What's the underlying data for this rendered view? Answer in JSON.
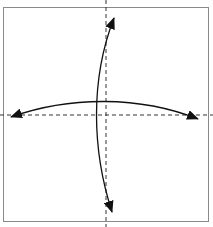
{
  "diagram": {
    "type": "origami-fold-instruction",
    "paper": {
      "shape": "square",
      "x": 3.5,
      "y": 7.5,
      "width": 205,
      "height": 214,
      "fill": "#ffffff",
      "stroke": "#8a8a8a"
    },
    "creases": [
      {
        "name": "vertical-valley-crease",
        "style": "dashed",
        "x1": 106,
        "y1": 0,
        "x2": 106,
        "y2": 227
      },
      {
        "name": "horizontal-valley-crease",
        "style": "dashed",
        "x1": 0,
        "y1": 115,
        "x2": 213,
        "y2": 115
      }
    ],
    "arrows": [
      {
        "name": "vertical-fold-unfold-arrow",
        "direction": "bidirectional",
        "from": [
          112,
          212
        ],
        "to": [
          114,
          18
        ]
      },
      {
        "name": "horizontal-fold-unfold-arrow",
        "direction": "bidirectional",
        "from": [
          11,
          117
        ],
        "to": [
          198,
          119
        ]
      }
    ],
    "colors": {
      "ink": "#111111",
      "crease": "#333333",
      "border": "#8a8a8a"
    }
  }
}
